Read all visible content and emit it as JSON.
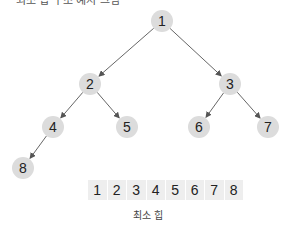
{
  "top_caption": "최소 힙 구조 예시 그림",
  "tree": {
    "nodes": [
      {
        "id": 1,
        "label": "1",
        "x": 162,
        "y": 21
      },
      {
        "id": 2,
        "label": "2",
        "x": 90,
        "y": 84
      },
      {
        "id": 3,
        "label": "3",
        "x": 230,
        "y": 84
      },
      {
        "id": 4,
        "label": "4",
        "x": 53,
        "y": 127
      },
      {
        "id": 5,
        "label": "5",
        "x": 127,
        "y": 127
      },
      {
        "id": 6,
        "label": "6",
        "x": 199,
        "y": 127
      },
      {
        "id": 7,
        "label": "7",
        "x": 268,
        "y": 127
      },
      {
        "id": 8,
        "label": "8",
        "x": 23,
        "y": 168
      }
    ],
    "edges": [
      [
        1,
        2
      ],
      [
        1,
        3
      ],
      [
        2,
        4
      ],
      [
        2,
        5
      ],
      [
        3,
        6
      ],
      [
        3,
        7
      ],
      [
        4,
        8
      ]
    ],
    "node_color": "#dcdcdc",
    "edge_color": "#555555"
  },
  "array": {
    "cells": [
      "1",
      "2",
      "3",
      "4",
      "5",
      "6",
      "7",
      "8"
    ],
    "caption": "최소 힙"
  }
}
